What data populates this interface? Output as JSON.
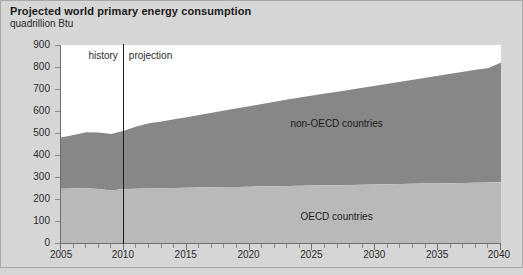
{
  "header": {
    "title": "Projected world primary energy consumption",
    "subtitle": "quadrillion Btu"
  },
  "annotations": {
    "history_label": "history",
    "projection_label": "projection",
    "divider_year": 2010
  },
  "labels": {
    "non_oecd": "non-OECD countries",
    "oecd": "OECD countries"
  },
  "colors": {
    "background": "#d6d6d6",
    "plot_background": "#ffffff",
    "non_oecd_fill": "#878787",
    "oecd_fill": "#b9b9b9",
    "axis": "#6f6f6f",
    "divider": "#1c1c1c",
    "text": "#2b2b2b"
  },
  "axes": {
    "y": {
      "label": "quadrillion Btu",
      "min": 0,
      "max": 900,
      "step": 100,
      "ticks": [
        900,
        800,
        700,
        600,
        500,
        400,
        300,
        200,
        100,
        0
      ]
    },
    "x": {
      "min": 2005,
      "max": 2040,
      "major_step": 5,
      "minor_step": 1,
      "ticks": [
        2005,
        2010,
        2015,
        2020,
        2025,
        2030,
        2035,
        2040
      ]
    },
    "grid": false
  },
  "chart_data": {
    "type": "area",
    "stacked": true,
    "title": "Projected world primary energy consumption",
    "subtitle": "quadrillion Btu",
    "xlabel": "",
    "ylabel": "quadrillion Btu",
    "xlim": [
      2005,
      2040
    ],
    "ylim": [
      0,
      900
    ],
    "grid": false,
    "legend_position": "inside-right",
    "x": [
      2005,
      2006,
      2007,
      2008,
      2009,
      2010,
      2011,
      2012,
      2013,
      2014,
      2015,
      2016,
      2017,
      2018,
      2019,
      2020,
      2021,
      2022,
      2023,
      2024,
      2025,
      2026,
      2027,
      2028,
      2029,
      2030,
      2031,
      2032,
      2033,
      2034,
      2035,
      2036,
      2037,
      2038,
      2039,
      2040
    ],
    "series": [
      {
        "name": "OECD countries",
        "fill": "#b9b9b9",
        "values": [
          247,
          248,
          249,
          246,
          239,
          245,
          247,
          248,
          249,
          250,
          251,
          252,
          253,
          254,
          255,
          256,
          257,
          258,
          259,
          260,
          261,
          262,
          263,
          264,
          265,
          266,
          267,
          268,
          269,
          270,
          271,
          272,
          273,
          274,
          275,
          276
        ]
      },
      {
        "name": "non-OECD countries",
        "fill": "#878787",
        "values": [
          233,
          243,
          254,
          256,
          256,
          265,
          283,
          296,
          303,
          313,
          321,
          330,
          339,
          348,
          357,
          366,
          375,
          384,
          393,
          401,
          409,
          417,
          425,
          433,
          441,
          449,
          457,
          465,
          473,
          481,
          489,
          497,
          505,
          513,
          521,
          544
        ]
      }
    ],
    "totals": [
      480,
      491,
      503,
      502,
      495,
      510,
      530,
      544,
      552,
      563,
      572,
      582,
      592,
      602,
      612,
      622,
      632,
      642,
      652,
      661,
      670,
      679,
      688,
      697,
      706,
      715,
      724,
      733,
      742,
      751,
      760,
      769,
      778,
      787,
      796,
      820
    ]
  }
}
